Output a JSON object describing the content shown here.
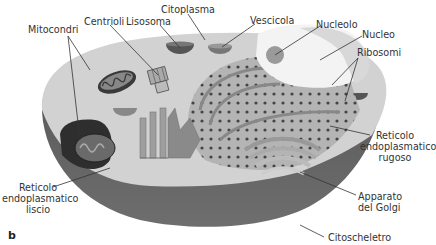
{
  "figure": {
    "panel_letter": "b",
    "colors": {
      "background": "#ffffff",
      "cytoplasm_top": "#d4d4d4",
      "membrane_side": "#5e5e5e",
      "membrane_bottom": "#6a6a6a",
      "nucleus": "#f2f2f2",
      "nucleolus": "#9a9a9a",
      "er_rough": "#a8a8a8",
      "ribosome": "#444444",
      "mitochondrion": "#3a3a3a",
      "leader_line": "#333333",
      "label_text": "#333333"
    }
  },
  "labels": {
    "mitocondri": "Mitocondri",
    "centrioli": "Centrioli",
    "lisosoma": "Lisosoma",
    "citoplasma": "Citoplasma",
    "vescicola": "Vescicola",
    "nucleolo": "Nucleolo",
    "nucleo": "Nucleo",
    "ribosomi": "Ribosomi",
    "rer_line1": "Reticolo",
    "rer_line2": "endoplasmatico",
    "rer_line3": "rugoso",
    "ser_line1": "Reticolo",
    "ser_line2": "endoplasmatico",
    "ser_line3": "liscio",
    "golgi_line1": "Apparato",
    "golgi_line2": "del Golgi",
    "citoscheletro": "Citoscheletro"
  }
}
